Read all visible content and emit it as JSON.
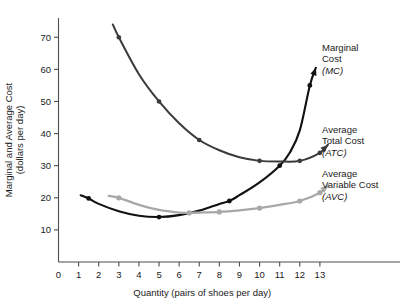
{
  "chart_data": {
    "type": "line",
    "title": "",
    "xlabel": "Quantity (pairs of shoes per day)",
    "ylabel": "Marginal and Average Cost (dollars per day)",
    "ylabel_line1": "Marginal and Average Cost",
    "ylabel_line2": "(dollars per day)",
    "xlim": [
      0,
      14
    ],
    "ylim": [
      0,
      76
    ],
    "xticks": [
      0,
      1,
      2,
      3,
      4,
      5,
      6,
      7,
      8,
      9,
      10,
      11,
      12,
      13
    ],
    "xtick_labels": [
      "0",
      "1",
      "2",
      "3",
      "4",
      "5",
      "6",
      "7",
      "8",
      "9",
      "10",
      "11",
      "12",
      "13"
    ],
    "yticks": [
      10,
      20,
      30,
      40,
      50,
      60,
      70
    ],
    "ytick_labels": [
      "10",
      "20",
      "30",
      "40",
      "50",
      "60",
      "70"
    ],
    "grid": false,
    "legend_position": "right-inline-annotations",
    "series": [
      {
        "name": "Marginal Cost",
        "abbr": "MC",
        "color": "#111111",
        "marker_points_x": [
          1.5,
          5.0,
          8.5,
          11.0,
          12.5
        ],
        "marker_points_y": [
          19.8,
          14.0,
          19.0,
          30.0,
          55.0
        ],
        "x": [
          1.1,
          1.5,
          2.0,
          3.0,
          4.0,
          5.0,
          6.0,
          7.0,
          8.0,
          8.5,
          9.0,
          10.0,
          11.0,
          11.5,
          12.0,
          12.5,
          12.8
        ],
        "y": [
          20.8,
          19.8,
          18.1,
          15.8,
          14.4,
          14.0,
          14.6,
          16.0,
          18.1,
          19.0,
          20.8,
          24.8,
          30.0,
          34.0,
          41.0,
          55.0,
          60.5
        ],
        "arrow_end": true
      },
      {
        "name": "Average Total Cost",
        "abbr": "ATC",
        "color": "#3a3a3a",
        "marker_points_x": [
          3.0,
          5.0,
          7.0,
          10.0,
          12.0,
          13.0
        ],
        "marker_points_y": [
          70.0,
          50.0,
          38.0,
          31.5,
          31.5,
          34.0
        ],
        "x": [
          2.7,
          3.0,
          4.0,
          5.0,
          6.0,
          7.0,
          8.0,
          9.0,
          10.0,
          11.0,
          12.0,
          13.0,
          13.4
        ],
        "y": [
          74.0,
          70.0,
          58.5,
          50.0,
          43.2,
          38.0,
          34.8,
          32.6,
          31.5,
          31.3,
          31.5,
          34.0,
          36.5
        ],
        "arrow_end": true
      },
      {
        "name": "Average Variable Cost",
        "abbr": "AVC",
        "color": "#a8a8a8",
        "marker_points_x": [
          3.0,
          6.5,
          8.0,
          10.0,
          12.0,
          13.0
        ],
        "marker_points_y": [
          20.0,
          15.3,
          15.6,
          16.8,
          19.0,
          21.6
        ],
        "x": [
          2.5,
          3.0,
          4.0,
          5.0,
          6.0,
          6.5,
          7.0,
          8.0,
          9.0,
          10.0,
          11.0,
          12.0,
          13.0,
          13.4
        ],
        "y": [
          20.6,
          20.0,
          17.8,
          16.2,
          15.4,
          15.3,
          15.4,
          15.6,
          16.1,
          16.8,
          17.8,
          19.0,
          21.6,
          23.8
        ],
        "arrow_end": true
      }
    ]
  },
  "annotations": {
    "mc": {
      "line1": "Marginal",
      "line2": "Cost",
      "abbr": "(MC)"
    },
    "atc": {
      "line1": "Average",
      "line2": "Total Cost",
      "abbr": "(ATC)"
    },
    "avc": {
      "line1": "Average",
      "line2": "Variable Cost",
      "abbr": "(AVC)"
    }
  }
}
